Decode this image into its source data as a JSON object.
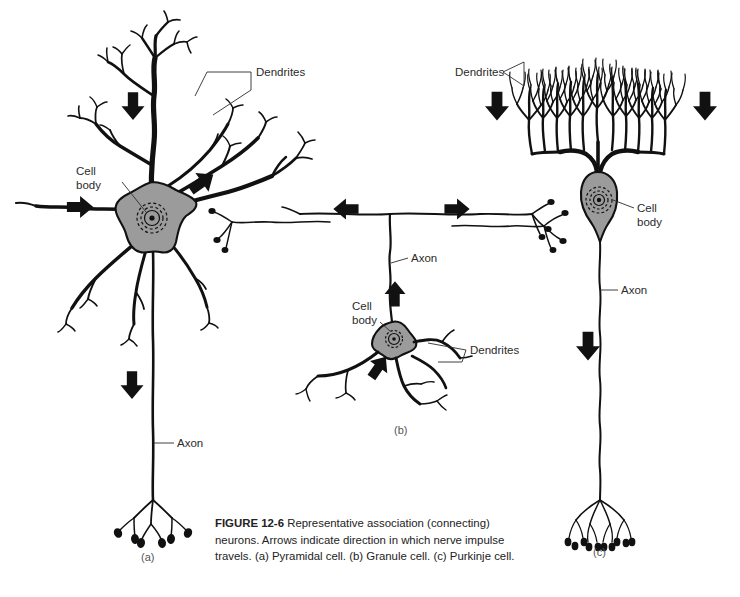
{
  "figure": {
    "number": "FIGURE 12-6",
    "caption_text": "Representative association (connecting) neurons. Arrows indicate direction in which nerve impulse travels. (a) Pyramidal cell. (b) Granule cell. (c) Purkinje cell.",
    "background_color": "#ffffff",
    "ink_color": "#111111",
    "soma_fill_color": "#9b9b9b",
    "label_color": "#2b2b2b"
  },
  "panels": [
    {
      "letter": "(a)",
      "cell_type": "Pyramidal cell",
      "labels": [
        {
          "name": "dendrites",
          "text": "Dendrites"
        },
        {
          "name": "cell-body",
          "text_line1": "Cell",
          "text_line2": "body"
        },
        {
          "name": "axon",
          "text": "Axon"
        }
      ],
      "arrow_count": 3,
      "arrow_directions": [
        "down",
        "down-left",
        "right"
      ]
    },
    {
      "letter": "(b)",
      "cell_type": "Granule cell",
      "labels": [
        {
          "name": "axon",
          "text": "Axon"
        },
        {
          "name": "cell-body",
          "text_line1": "Cell",
          "text_line2": "body"
        },
        {
          "name": "dendrites",
          "text": "Dendrites"
        }
      ],
      "arrow_count": 4,
      "arrow_directions": [
        "left",
        "right",
        "up",
        "up-right"
      ]
    },
    {
      "letter": "(c)",
      "cell_type": "Purkinje cell",
      "labels": [
        {
          "name": "dendrites",
          "text": "Dendrites"
        },
        {
          "name": "cell-body",
          "text_line1": "Cell",
          "text_line2": "body"
        },
        {
          "name": "axon",
          "text": "Axon"
        }
      ],
      "arrow_count": 3,
      "arrow_directions": [
        "down",
        "down",
        "down"
      ]
    }
  ]
}
